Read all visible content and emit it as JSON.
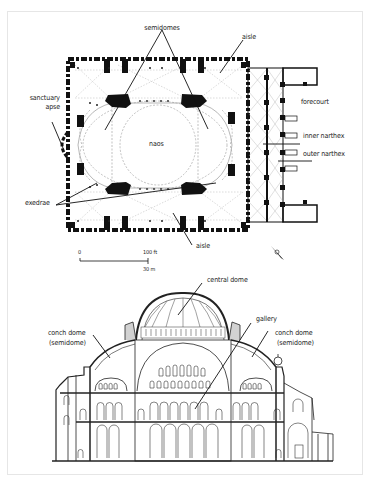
{
  "figure": {
    "plan": {
      "labels": {
        "semidomes": "semidomes",
        "aisle_top": "aisle",
        "sanctuary_apse_line1": "sanctuary",
        "sanctuary_apse_line2": "apse",
        "forecourt": "forecourt",
        "naos": "naos",
        "inner_narthex": "inner narthex",
        "outer_narthex": "outer narthex",
        "exedrae": "exedrae",
        "aisle_bottom": "aisle"
      },
      "scale_bar": {
        "start_label": "0",
        "end_label_ft": "100 ft",
        "end_label_m": "30 m"
      },
      "north_arrow": "north-arrow"
    },
    "section": {
      "labels": {
        "central_dome": "central dome",
        "gallery": "gallery",
        "conch_left_line1": "conch dome",
        "conch_left_line2": "(semidome)",
        "conch_right_line1": "conch dome",
        "conch_right_line2": "(semidome)"
      }
    }
  },
  "colors": {
    "ink": "#111111",
    "hatch": "#9a9a9a",
    "fill_gray": "#cfcfcf",
    "frame_border": "#e6e6e6"
  }
}
